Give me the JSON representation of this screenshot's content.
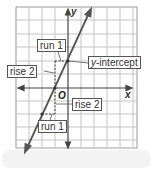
{
  "diagram": {
    "type": "coordinate-plane-line-slope",
    "axes": {
      "x_label": "x",
      "y_label": "y",
      "origin_label": "O"
    },
    "grid": {
      "columns": 9,
      "rows": 11,
      "line_color": "#bbbbbb",
      "border_color": "#999999"
    },
    "line": {
      "color": "#555555",
      "slope": 2,
      "y_intercept_units": 2
    },
    "annotations": [
      {
        "id": "run-top",
        "text": "run 1"
      },
      {
        "id": "rise-top",
        "text": "rise 2"
      },
      {
        "id": "y-intercept",
        "prefix": "y",
        "text": "-intercept"
      },
      {
        "id": "rise-bottom",
        "text": "rise 2"
      },
      {
        "id": "run-bottom",
        "text": "run 1"
      }
    ]
  }
}
